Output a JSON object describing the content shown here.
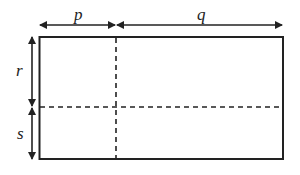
{
  "diagram": {
    "type": "rectangle-partition",
    "labels": {
      "top_left": "p",
      "top_right": "q",
      "left_top": "r",
      "left_bottom": "s"
    },
    "colors": {
      "stroke": "#222222",
      "background": "#ffffff"
    }
  }
}
